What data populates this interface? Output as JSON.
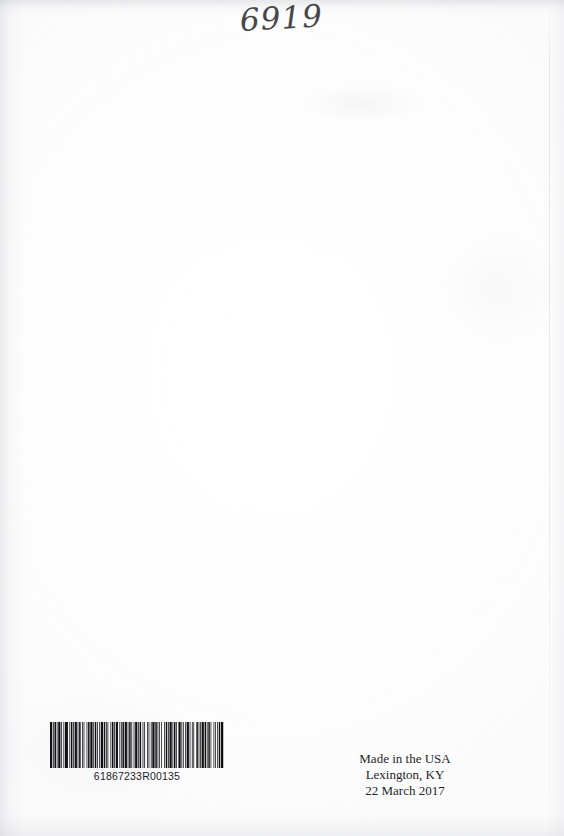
{
  "page": {
    "kind": "scanned-book-back-cover",
    "background_color": "#fefefe",
    "ink_color": "#26262a"
  },
  "handwriting": {
    "value": "6919",
    "color": "#2e2e32"
  },
  "barcode": {
    "symbology_label": "barcode-icon",
    "human_readable_number": "61867233R00135",
    "bar_color": "#101013",
    "pattern": [
      3,
      1,
      1,
      1,
      2,
      1,
      1,
      1,
      3,
      1,
      1,
      2,
      1,
      1,
      4,
      2,
      1,
      1,
      2,
      1,
      1,
      1,
      3,
      1,
      1,
      1,
      2,
      2,
      1,
      1,
      1,
      3,
      1,
      1,
      2,
      1,
      3,
      1,
      1,
      1,
      2,
      1,
      1,
      2,
      1,
      1,
      3,
      1,
      2,
      1,
      1,
      1,
      1,
      3,
      1,
      1,
      2,
      1,
      1,
      1,
      3,
      2,
      1,
      1,
      1,
      1,
      2,
      1,
      3,
      1,
      1,
      1,
      2,
      1,
      1,
      2,
      1,
      1,
      3,
      1,
      1,
      1,
      2,
      2,
      1,
      1,
      1,
      3,
      1,
      1,
      1,
      2,
      1,
      1,
      3,
      1,
      2,
      1,
      1,
      1,
      1,
      2,
      1,
      3,
      1,
      1,
      2,
      1,
      1,
      1,
      3,
      1,
      1,
      1,
      2,
      1,
      1,
      2,
      3,
      1,
      1,
      1,
      1,
      2,
      1,
      1,
      3,
      1,
      1,
      2,
      1,
      1,
      1,
      3,
      2,
      1,
      1,
      1,
      1,
      1,
      3,
      1,
      2,
      1,
      1,
      1,
      2,
      1,
      1,
      3,
      1,
      1,
      1,
      2,
      1,
      1,
      2,
      1,
      3,
      1
    ]
  },
  "imprint": {
    "lines": [
      "Made in the USA",
      "Lexington, KY",
      "22 March 2017"
    ],
    "line_1": "Made in the USA",
    "line_2": "Lexington, KY",
    "line_3": "22 March 2017"
  }
}
